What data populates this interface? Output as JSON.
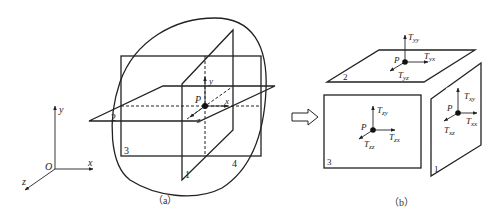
{
  "figure": {
    "panel_a": {
      "caption": "（a）",
      "axes": {
        "origin": "O",
        "x": "x",
        "y": "y",
        "z": "z"
      },
      "plane_labels": [
        "1",
        "2",
        "3",
        "4"
      ],
      "point_label": "P",
      "local_axes": {
        "x": "x",
        "y": "y",
        "z": "z"
      }
    },
    "arrow": {
      "name": "implies-arrow"
    },
    "panel_b": {
      "caption": "（b）",
      "faces": {
        "top": {
          "label": "2",
          "point": "P",
          "stresses": [
            {
              "T": "T",
              "sub": "yy"
            },
            {
              "T": "T",
              "sub": "yx"
            },
            {
              "T": "T",
              "sub": "yz"
            }
          ]
        },
        "front": {
          "label": "3",
          "point": "P",
          "stresses": [
            {
              "T": "T",
              "sub": "zy"
            },
            {
              "T": "T",
              "sub": "zx"
            },
            {
              "T": "T",
              "sub": "zz"
            }
          ]
        },
        "right": {
          "label": "1",
          "point": "P",
          "stresses": [
            {
              "T": "T",
              "sub": "xy"
            },
            {
              "T": "T",
              "sub": "xx"
            },
            {
              "T": "T",
              "sub": "xz"
            }
          ]
        }
      }
    }
  }
}
